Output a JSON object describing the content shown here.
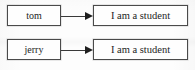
{
  "diagram": {
    "type": "flow",
    "title": "",
    "background_color": "#fdfdfd",
    "border_color": "#4a4a4a",
    "text_color": "#1d1d1d",
    "arrow_color": "#1f1f1f",
    "rows": [
      {
        "source_label": "tom",
        "arrow_label": "",
        "target_label": "I am a student"
      },
      {
        "source_label": "jerry",
        "arrow_label": "",
        "target_label": "I am a student"
      }
    ]
  }
}
